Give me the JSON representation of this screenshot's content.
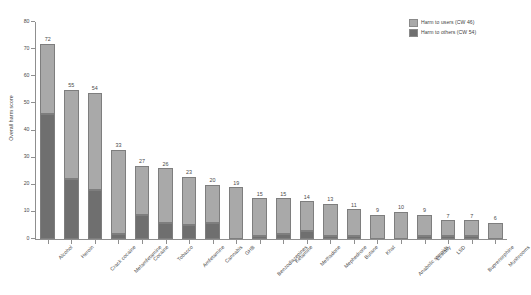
{
  "chart_data": {
    "type": "bar",
    "subtype": "stacked-bar",
    "title": "",
    "xlabel": "",
    "ylabel": "Overall harm score",
    "ylim": [
      0,
      80
    ],
    "yticks": [
      0,
      10,
      20,
      30,
      40,
      50,
      60,
      70,
      80
    ],
    "grid": false,
    "legend_position": "top-right",
    "categories": [
      "Alcohol",
      "Heroin",
      "Crack cocaine",
      "Metamfetamine",
      "Cocaine",
      "Tobacco",
      "Amfetamine",
      "Cannabis",
      "GHB",
      "Benzodiazepines",
      "Ketamine",
      "Methadone",
      "Mephedrone",
      "Butane",
      "Khat",
      "Anabolic steroids",
      "Ecstasy",
      "LSD",
      "Buprenorphine",
      "Mushrooms"
    ],
    "totals": [
      72,
      55,
      54,
      33,
      27,
      26,
      23,
      20,
      19,
      15,
      15,
      14,
      13,
      11,
      9,
      10,
      9,
      7,
      7,
      6
    ],
    "series": [
      {
        "name": "Harm to users (CW 46)",
        "color": "#a9a9a9",
        "values": [
          26,
          33,
          36,
          31,
          18,
          20,
          18,
          14,
          19,
          14,
          13,
          11,
          12,
          10,
          9,
          10,
          8,
          6,
          6,
          6
        ]
      },
      {
        "name": "Harm to others (CW 54)",
        "color": "#6f6f6f",
        "values": [
          46,
          22,
          18,
          2,
          9,
          6,
          5,
          6,
          0,
          1,
          2,
          3,
          1,
          1,
          0,
          0,
          1,
          1,
          1,
          0
        ]
      }
    ]
  },
  "legend": {
    "items": [
      {
        "label": "Harm to users (CW 46)",
        "color": "#a9a9a9"
      },
      {
        "label": "Harm to others (CW 54)",
        "color": "#6f6f6f"
      }
    ]
  },
  "axes": {
    "y_title": "Overall harm score",
    "y_tick_labels": [
      "0",
      "10",
      "20",
      "30",
      "40",
      "50",
      "60",
      "70",
      "80"
    ]
  }
}
